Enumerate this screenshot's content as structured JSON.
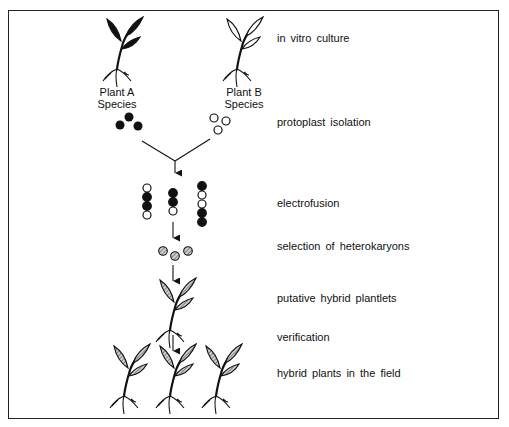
{
  "figure": {
    "colors": {
      "frame": "#222222",
      "ink": "#111111",
      "hybrid_fill": "#9a9a9a",
      "background": "#ffffff"
    }
  },
  "sources": {
    "plant_a": {
      "line1": "Plant  A",
      "line2": "Species",
      "style": "solid-black"
    },
    "plant_b": {
      "line1": "Plant  B",
      "line2": "Species",
      "style": "outline"
    }
  },
  "steps": [
    {
      "id": "in-vitro-culture",
      "label": "in  vitro  culture"
    },
    {
      "id": "protoplast-isolation",
      "label": "protoplast  isolation"
    },
    {
      "id": "electrofusion",
      "label": "electrofusion"
    },
    {
      "id": "selection",
      "label": "selection  of  heterokaryons"
    },
    {
      "id": "putative-plantlets",
      "label": "putative  hybrid  plantlets"
    },
    {
      "id": "verification",
      "label": "verification"
    },
    {
      "id": "field-plants",
      "label": "hybrid  plants  in  the  field"
    }
  ],
  "fusion_columns": [
    [
      "open",
      "filled",
      "filled",
      "open"
    ],
    [
      "filled",
      "filled",
      "open"
    ],
    [
      "filled",
      "open",
      "open",
      "filled",
      "filled"
    ]
  ],
  "heterokaryon_count": 3,
  "field_plant_count": 3
}
